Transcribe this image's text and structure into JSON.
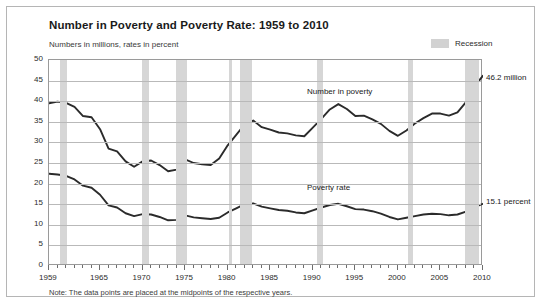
{
  "title": "Number in Poverty and Poverty Rate: 1959 to 2010",
  "subtitle": "Numbers in millions, rates in percent",
  "legend": {
    "recession_label": "Recession",
    "recession_color": "#d6d6d6"
  },
  "note": "Note:  The data points are placed at the midpoints of the respective years.",
  "annotations": {
    "number_series_label": "Number in poverty",
    "rate_series_label": "Poverty rate",
    "number_end_label": "46.2 million",
    "rate_end_label": "15.1 percent"
  },
  "chart_data": {
    "type": "line",
    "title": "Number in Poverty and Poverty Rate: 1959 to 2010",
    "subtitle": "Numbers in millions, rates in percent",
    "xlabel": "",
    "ylabel": "Numbers in millions, rates in percent",
    "ylim": [
      0,
      50
    ],
    "ytick_step": 5,
    "yticks": [
      0,
      5,
      10,
      15,
      20,
      25,
      30,
      35,
      40,
      45,
      50
    ],
    "xlim": [
      1959,
      2010
    ],
    "xticks": [
      1959,
      1965,
      1970,
      1975,
      1980,
      1985,
      1990,
      1995,
      2000,
      2005,
      2010
    ],
    "xtick_minor_step": 1,
    "grid": "horizontal",
    "legend_position": "top-right",
    "line_color": "#2b2b2b",
    "x": [
      1959,
      1960,
      1961,
      1962,
      1963,
      1964,
      1965,
      1966,
      1967,
      1968,
      1969,
      1970,
      1971,
      1972,
      1973,
      1974,
      1975,
      1976,
      1977,
      1978,
      1979,
      1980,
      1981,
      1982,
      1983,
      1984,
      1985,
      1986,
      1987,
      1988,
      1989,
      1990,
      1991,
      1992,
      1993,
      1994,
      1995,
      1996,
      1997,
      1998,
      1999,
      2000,
      2001,
      2002,
      2003,
      2004,
      2005,
      2006,
      2007,
      2008,
      2009,
      2010
    ],
    "series": [
      {
        "name": "Number in poverty",
        "units": "millions",
        "end_label": "46.2 million",
        "values": [
          39.5,
          39.9,
          39.6,
          38.6,
          36.4,
          36.1,
          33.2,
          28.5,
          27.8,
          25.4,
          24.1,
          25.4,
          25.6,
          24.5,
          23.0,
          23.4,
          25.9,
          25.0,
          24.7,
          24.5,
          26.1,
          29.3,
          31.8,
          34.4,
          35.3,
          33.7,
          33.1,
          32.4,
          32.2,
          31.7,
          31.5,
          33.6,
          35.7,
          38.0,
          39.3,
          38.1,
          36.4,
          36.5,
          35.6,
          34.5,
          32.8,
          31.6,
          32.9,
          34.6,
          35.9,
          37.0,
          37.0,
          36.5,
          37.3,
          39.8,
          43.6,
          46.2
        ]
      },
      {
        "name": "Poverty rate",
        "units": "percent",
        "end_label": "15.1 percent",
        "values": [
          22.4,
          22.2,
          21.9,
          21.0,
          19.5,
          19.0,
          17.3,
          14.7,
          14.2,
          12.8,
          12.1,
          12.6,
          12.5,
          11.9,
          11.1,
          11.2,
          12.3,
          11.8,
          11.6,
          11.4,
          11.7,
          13.0,
          14.0,
          15.0,
          15.2,
          14.4,
          14.0,
          13.6,
          13.4,
          13.0,
          12.8,
          13.5,
          14.2,
          14.8,
          15.1,
          14.5,
          13.8,
          13.7,
          13.3,
          12.7,
          11.9,
          11.3,
          11.7,
          12.1,
          12.5,
          12.7,
          12.6,
          12.3,
          12.5,
          13.2,
          14.3,
          15.1
        ]
      }
    ],
    "recessions": [
      {
        "start": 1960.3,
        "end": 1961.1
      },
      {
        "start": 1969.9,
        "end": 1970.8
      },
      {
        "start": 1973.9,
        "end": 1975.2
      },
      {
        "start": 1980.1,
        "end": 1980.5
      },
      {
        "start": 1981.5,
        "end": 1982.9
      },
      {
        "start": 1990.5,
        "end": 1991.2
      },
      {
        "start": 2001.2,
        "end": 2001.8
      },
      {
        "start": 2007.9,
        "end": 2009.5
      }
    ]
  }
}
